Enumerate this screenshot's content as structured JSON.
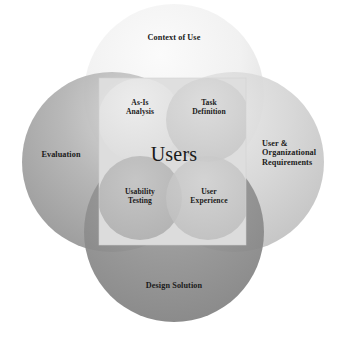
{
  "diagram": {
    "title_center": "Users",
    "type": "four-circle-venn",
    "background_color": "#ffffff",
    "text_color": "#1a1a1a",
    "outer_circles": [
      {
        "key": "context-of-use",
        "label": "Context of Use",
        "position": "top",
        "fill_color": "#eeeeee",
        "cx": 174,
        "cy": 94,
        "r": 90
      },
      {
        "key": "evaluation",
        "label": "Evaluation",
        "position": "left",
        "fill_color": "#a5a5a5",
        "cx": 112,
        "cy": 162,
        "r": 90
      },
      {
        "key": "user-organizational-requirements",
        "label": "User &\nOrganizational\nRequirements",
        "position": "right",
        "fill_color": "#d2d2d2",
        "cx": 234,
        "cy": 162,
        "r": 90
      },
      {
        "key": "design-solution",
        "label": "Design Solution",
        "position": "bottom",
        "fill_color": "#8b8b8b",
        "cx": 174,
        "cy": 232,
        "r": 90
      }
    ],
    "inner_circles": [
      {
        "key": "as-is-analysis",
        "label": "As-Is\nAnalysis",
        "position": "top-left",
        "fill_color": "#e2e2e2",
        "cx": 140,
        "cy": 120,
        "r": 42
      },
      {
        "key": "task-definition",
        "label": "Task\nDefinition",
        "position": "top-right",
        "fill_color": "#cfcfcf",
        "cx": 208,
        "cy": 120,
        "r": 42
      },
      {
        "key": "usability-testing",
        "label": "Usability\nTesting",
        "position": "bottom-left",
        "fill_color": "#b4b4b4",
        "cx": 140,
        "cy": 198,
        "r": 42
      },
      {
        "key": "user-experience",
        "label": "User\nExperience",
        "position": "bottom-right",
        "fill_color": "#c6c6c6",
        "cx": 208,
        "cy": 198,
        "r": 42
      }
    ],
    "center_square": {
      "key": "users-core",
      "fill_color": "#dcdcdc",
      "x": 99,
      "y": 78,
      "width": 147,
      "height": 167
    }
  }
}
